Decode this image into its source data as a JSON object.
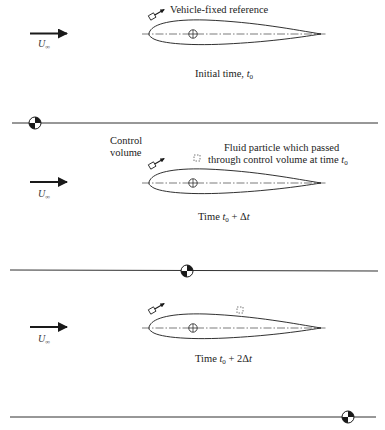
{
  "figure": {
    "panels": [
      {
        "id": "initial",
        "freestream_label": "U",
        "freestream_subscript": "∞",
        "annotation": "Vehicle-fixed reference",
        "caption_prefix": "Initial time, ",
        "caption_var": "t",
        "caption_sub": "0",
        "caption_suffix": ""
      },
      {
        "id": "t0-plus-dt",
        "freestream_label": "U",
        "freestream_subscript": "∞",
        "control_volume_label_line1": "Control",
        "control_volume_label_line2": "volume",
        "particle_label_line1": "Fluid particle which passed",
        "particle_label_line2_prefix": "through control volume at time ",
        "particle_label_var": "t",
        "particle_label_sub": "0",
        "caption_prefix": "Time ",
        "caption_var": "t",
        "caption_sub": "0",
        "caption_suffix": " + Δ",
        "caption_suffix_var": "t"
      },
      {
        "id": "t0-plus-2dt",
        "freestream_label": "U",
        "freestream_subscript": "∞",
        "caption_prefix": "Time ",
        "caption_var": "t",
        "caption_sub": "0",
        "caption_suffix": " + 2Δ",
        "caption_suffix_var": "t"
      }
    ],
    "ground_lines": [
      {
        "y": 123,
        "marker_x": 35
      },
      {
        "y": 270,
        "marker_x": 187
      },
      {
        "y": 417,
        "marker_x": 348
      }
    ],
    "icons": [
      "freestream-arrow-icon",
      "vehicle-fixed-reference-icon",
      "airfoil-centroid-icon",
      "fluid-particle-icon",
      "ground-fixed-reference-icon"
    ],
    "colors": {
      "ink": "#1a1a1a",
      "background": "#ffffff"
    }
  }
}
